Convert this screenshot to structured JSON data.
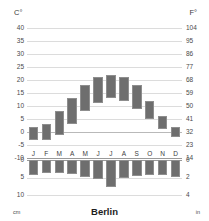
{
  "chart_data": {
    "type": "bar",
    "title": "Berlin",
    "subtitle": "",
    "xlabel": "",
    "ylabel": "Temperature (C°) / Precipitation (cm)",
    "categories": [
      "J",
      "F",
      "M",
      "A",
      "M",
      "J",
      "J",
      "A",
      "S",
      "O",
      "N",
      "D"
    ],
    "temperature_unit_left": "C°",
    "temperature_unit_right": "F°",
    "precipitation_unit_left": "cm",
    "precipitation_unit_right": "in",
    "temp_ylim": [
      -10,
      40
    ],
    "temp_ticks_c": [
      40,
      35,
      30,
      25,
      20,
      15,
      10,
      5,
      0,
      -5,
      -10
    ],
    "temp_ticks_f": [
      104,
      95,
      86,
      77,
      68,
      59,
      50,
      41,
      32,
      23,
      14
    ],
    "precip_ylim_cm": [
      0,
      10
    ],
    "precip_ticks_cm": [
      0,
      5,
      10
    ],
    "precip_ticks_in": [
      0,
      2,
      4
    ],
    "grid": true,
    "legend": "none",
    "series": [
      {
        "name": "Temperature range (min–max °C)",
        "min": [
          -3,
          -3,
          -1,
          3,
          8,
          11,
          13,
          12,
          9,
          5,
          1,
          -2
        ],
        "max": [
          2,
          3,
          8,
          13,
          18,
          21,
          22,
          21,
          18,
          12,
          6,
          2
        ]
      },
      {
        "name": "Precipitation (cm)",
        "values": [
          4.3,
          3.8,
          3.8,
          4.0,
          4.8,
          5.5,
          7.8,
          5.0,
          4.5,
          4.2,
          4.3,
          4.8
        ]
      }
    ]
  },
  "axes": {
    "left_unit_label": "C°",
    "right_unit_label": "F°",
    "bottom_left_unit": "cm",
    "bottom_right_unit": "in"
  },
  "title": {
    "text": "Berlin"
  },
  "colors": {
    "bar_fill": "#6e6e6e",
    "bar_stroke": "#8e8e8e",
    "gridline": "#dcdcdc",
    "axis_text": "#4a4a4a",
    "title_text": "#1d1d1d",
    "background": "#ffffff"
  }
}
